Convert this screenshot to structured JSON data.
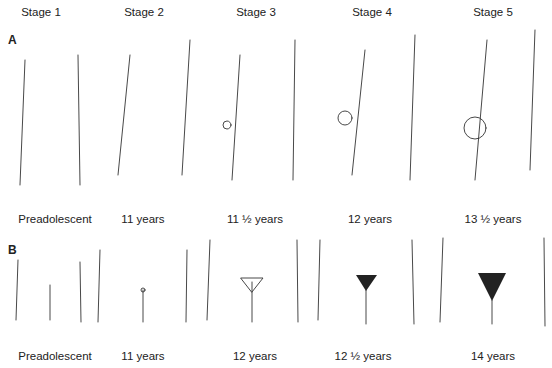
{
  "figure": {
    "stages": [
      "Stage 1",
      "Stage 2",
      "Stage 3",
      "Stage 4",
      "Stage 5"
    ],
    "panel_a": {
      "label": "A",
      "captions": [
        "Preadolescent",
        "11 years",
        "11 ½ years",
        "12 years",
        "13 ½ years"
      ]
    },
    "panel_b": {
      "label": "B",
      "captions": [
        "Preadolescent",
        "11 years",
        "12 years",
        "12 ½ years",
        "14 years"
      ]
    }
  }
}
